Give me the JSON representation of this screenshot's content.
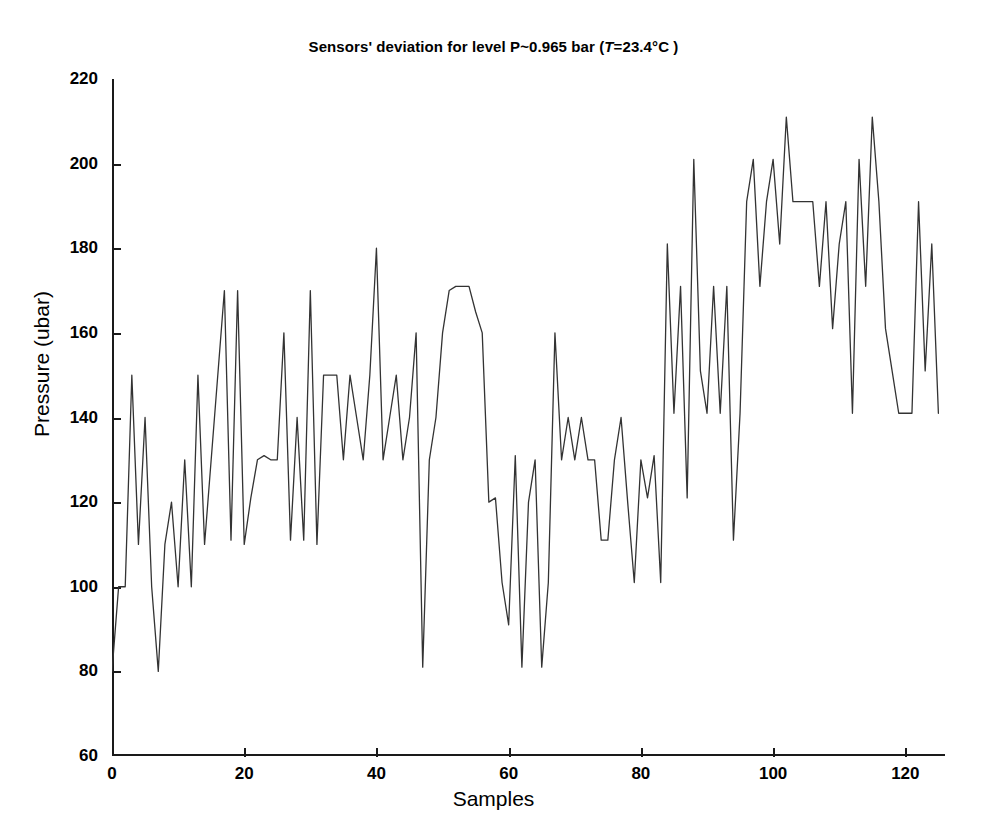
{
  "chart_data": {
    "type": "line",
    "title": "Sensors' deviation for level P~0.965 bar (T=23.4°C )",
    "title_parts": {
      "before": "Sensors' deviation for level P~0.965 bar (",
      "italic": "T",
      "after": "=23.4°C )"
    },
    "xlabel": "Samples",
    "ylabel": "Pressure (ubar)",
    "xlim": [
      0,
      126
    ],
    "ylim": [
      60,
      220
    ],
    "xticks": [
      0,
      20,
      40,
      60,
      80,
      100,
      120
    ],
    "yticks": [
      60,
      80,
      100,
      120,
      140,
      160,
      180,
      200,
      220
    ],
    "grid": false,
    "legend": null,
    "line_color": "#333333",
    "line_width": 1.2,
    "series": [
      {
        "name": "Sensor deviation",
        "x": [
          0,
          1,
          2,
          3,
          4,
          5,
          6,
          7,
          8,
          9,
          10,
          11,
          12,
          13,
          14,
          15,
          16,
          17,
          18,
          19,
          20,
          21,
          22,
          23,
          24,
          25,
          26,
          27,
          28,
          29,
          30,
          31,
          32,
          33,
          34,
          35,
          36,
          37,
          38,
          39,
          40,
          41,
          42,
          43,
          44,
          45,
          46,
          47,
          48,
          49,
          50,
          51,
          52,
          53,
          54,
          55,
          56,
          57,
          58,
          59,
          60,
          61,
          62,
          63,
          64,
          65,
          66,
          67,
          68,
          69,
          70,
          71,
          72,
          73,
          74,
          75,
          76,
          77,
          78,
          79,
          80,
          81,
          82,
          83,
          84,
          85,
          86,
          87,
          88,
          89,
          90,
          91,
          92,
          93,
          94,
          95,
          96,
          97,
          98,
          99,
          100,
          101,
          102,
          103,
          104,
          105,
          106,
          107,
          108,
          109,
          110,
          111,
          112,
          113,
          114,
          115,
          116,
          117,
          118,
          119,
          120,
          121,
          122,
          123,
          124,
          125
        ],
        "values": [
          80,
          100,
          100,
          150,
          110,
          140,
          100,
          80,
          110,
          120,
          100,
          130,
          100,
          150,
          110,
          130,
          150,
          170,
          111,
          170,
          110,
          121,
          130,
          131,
          130,
          130,
          160,
          111,
          140,
          111,
          170,
          110,
          150,
          150,
          150,
          130,
          150,
          140,
          130,
          150,
          180,
          130,
          140,
          150,
          130,
          140,
          160,
          81,
          130,
          140,
          160,
          170,
          171,
          171,
          171,
          165,
          160,
          120,
          121,
          101,
          91,
          131,
          81,
          120,
          130,
          81,
          101,
          160,
          130,
          140,
          130,
          140,
          130,
          130,
          111,
          111,
          130,
          140,
          120,
          101,
          130,
          121,
          131,
          101,
          181,
          141,
          171,
          121,
          201,
          151,
          141,
          171,
          141,
          171,
          111,
          141,
          191,
          201,
          171,
          191,
          201,
          181,
          211,
          191,
          191,
          191,
          191,
          171,
          191,
          161,
          181,
          191,
          141,
          201,
          171,
          211,
          191,
          161,
          151,
          141,
          141,
          141,
          191,
          151,
          181,
          141
        ]
      }
    ]
  },
  "axis": {
    "ytick_labels": [
      "220",
      "200",
      "180",
      "160",
      "140",
      "120",
      "100",
      "80",
      "60"
    ],
    "xtick_labels": [
      "0",
      "20",
      "40",
      "60",
      "80",
      "100",
      "120"
    ]
  }
}
